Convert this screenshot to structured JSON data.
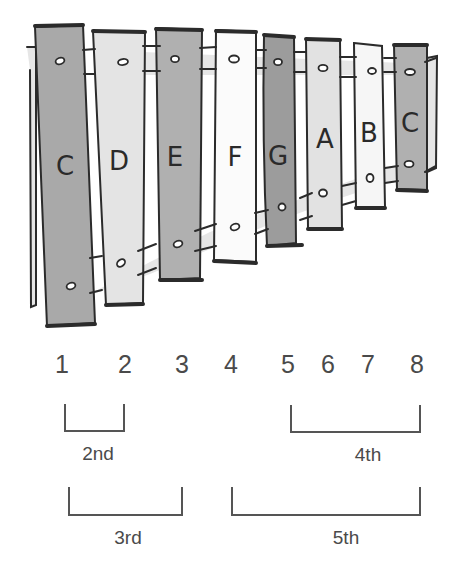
{
  "diagram": {
    "type": "xylophone-intervals",
    "bars": [
      {
        "note": "C",
        "shade": "#a9a9a9"
      },
      {
        "note": "D",
        "shade": "#e4e4e4"
      },
      {
        "note": "E",
        "shade": "#b0b0b0"
      },
      {
        "note": "F",
        "shade": "#fbfbfb"
      },
      {
        "note": "G",
        "shade": "#9c9c9c"
      },
      {
        "note": "A",
        "shade": "#e2e2e2"
      },
      {
        "note": "B",
        "shade": "#f6f6f6"
      },
      {
        "note": "C",
        "shade": "#b0b0b0"
      }
    ],
    "scale_degrees": [
      "1",
      "2",
      "3",
      "4",
      "5",
      "6",
      "7",
      "8"
    ],
    "intervals": [
      {
        "label": "2nd",
        "from": "1",
        "to": "2"
      },
      {
        "label": "4th",
        "from": "5",
        "to": "8"
      },
      {
        "label": "3rd",
        "from": "1",
        "to": "3"
      },
      {
        "label": "5th",
        "from": "4",
        "to": "8"
      }
    ],
    "colors": {
      "outline": "#2b2b2b",
      "rail": "#e6e6e6",
      "text": "#4a4a4a"
    }
  }
}
